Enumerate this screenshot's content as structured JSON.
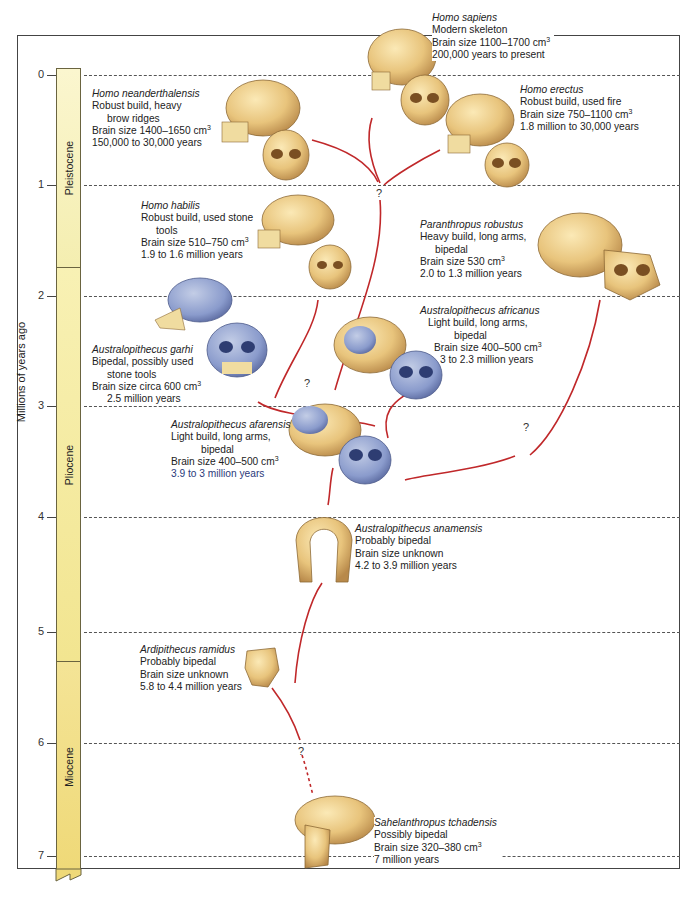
{
  "diagram": {
    "axis_title": "Millions of years ago",
    "ticks": [
      "0",
      "1",
      "2",
      "3",
      "4",
      "5",
      "6",
      "7"
    ],
    "epochs": [
      {
        "name": "Pleistocene",
        "color": "#f6f0b8"
      },
      {
        "name": "Pliocene",
        "color": "#f6ecaa"
      },
      {
        "name": "Miocene",
        "color": "#f1df86"
      }
    ],
    "uncertain_marker": "?",
    "line_color": "#c0282a",
    "species": [
      {
        "id": "homo-sapiens",
        "name": "Homo sapiens",
        "lines": [
          "Modern skeleton",
          "Brain size 1100–1700 cm",
          "200,000 years to present"
        ],
        "sup": "3"
      },
      {
        "id": "homo-neanderthalensis",
        "name": "Homo neanderthalensis",
        "lines": [
          "Robust build, heavy",
          "brow ridges",
          "Brain size 1400–1650 cm",
          "150,000 to 30,000 years"
        ],
        "sup": "3"
      },
      {
        "id": "homo-erectus",
        "name": "Homo erectus",
        "lines": [
          "Robust build, used fire",
          "Brain size 750–1100 cm",
          "1.8 million to 30,000 years"
        ],
        "sup": "3"
      },
      {
        "id": "homo-habilis",
        "name": "Homo habilis",
        "lines": [
          "Robust build, used stone",
          "tools",
          "Brain size 510–750 cm",
          "1.9 to 1.6 million years"
        ],
        "sup": "3"
      },
      {
        "id": "paranthropus-robustus",
        "name": "Paranthropus robustus",
        "lines": [
          "Heavy build, long arms,",
          "bipedal",
          "Brain size 530 cm",
          "2.0 to 1.3 million years"
        ],
        "sup": "3"
      },
      {
        "id": "australopithecus-garhi",
        "name": "Australopithecus garhi",
        "lines": [
          "Bipedal, possibly used",
          "stone tools",
          "Brain size circa 600 cm",
          "2.5 million years"
        ],
        "sup": "3"
      },
      {
        "id": "australopithecus-africanus",
        "name": "Australopithecus africanus",
        "lines": [
          "Light build, long arms,",
          "bipedal",
          "Brain size 400–500 cm",
          "3 to 2.3 million years"
        ],
        "sup": "3"
      },
      {
        "id": "australopithecus-afarensis",
        "name": "Australopithecus afarensis",
        "lines": [
          "Light build, long arms,",
          "bipedal",
          "Brain size 400–500 cm",
          "3.9 to 3 million years"
        ],
        "sup": "3"
      },
      {
        "id": "australopithecus-anamensis",
        "name": "Australopithecus anamensis",
        "lines": [
          "Probably bipedal",
          "Brain size unknown",
          "4.2 to 3.9 million years"
        ]
      },
      {
        "id": "ardipithecus-ramidus",
        "name": "Ardipithecus ramidus",
        "lines": [
          "Probably bipedal",
          "Brain size unknown",
          "5.8 to 4.4 million years"
        ]
      },
      {
        "id": "sahelanthropus-tchadensis",
        "name": "Sahelanthropus tchadensis",
        "lines": [
          "Possibly bipedal",
          "Brain size 320–380 cm",
          "7 million years"
        ],
        "sup": "3"
      }
    ]
  }
}
